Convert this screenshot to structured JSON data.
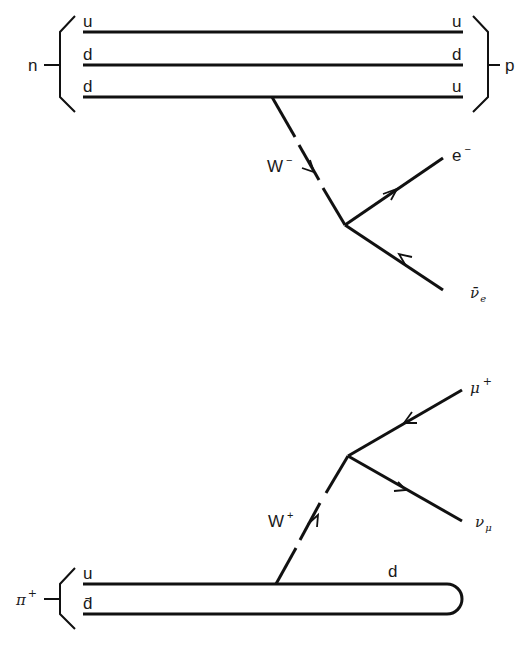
{
  "diagrams": [
    {
      "name": "neutron-beta-decay",
      "initial_hadron": "n",
      "final_hadron": "p",
      "quarks_left": [
        "u",
        "d",
        "d"
      ],
      "quarks_right": [
        "u",
        "d",
        "u"
      ],
      "boson": {
        "label": "W",
        "charge": "−"
      },
      "outgoing": [
        {
          "label": "e",
          "sup": "−",
          "arrow": "outgoing"
        },
        {
          "label": "ν̄",
          "sub": "e",
          "arrow": "incoming"
        }
      ]
    },
    {
      "name": "pion-decay",
      "initial_hadron": {
        "label": "π",
        "sup": "+"
      },
      "quarks_left": [
        "u",
        "d̄"
      ],
      "quark_label_right": "d",
      "boson": {
        "label": "W",
        "charge": "+"
      },
      "outgoing": [
        {
          "label": "μ",
          "sup": "+",
          "arrow": "incoming"
        },
        {
          "label": "ν",
          "sub": "μ",
          "arrow": "outgoing"
        }
      ]
    }
  ]
}
